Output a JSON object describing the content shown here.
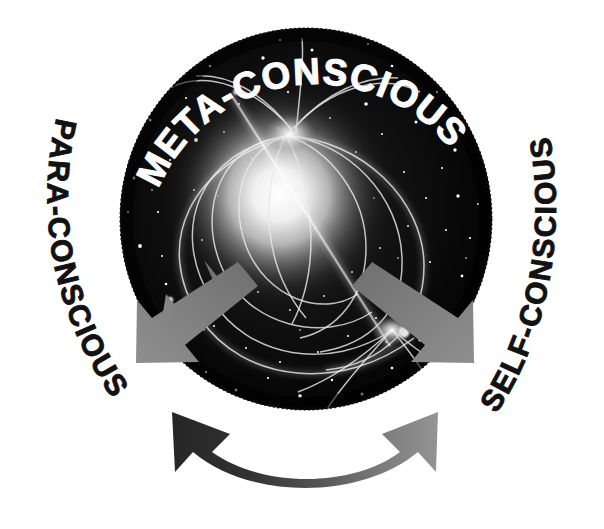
{
  "diagram": {
    "background_color": "#ffffff",
    "center": {
      "name": "magnetar-sphere",
      "description": "starfield sphere with glowing neutron star and magnetic field lines",
      "label": "META-CONSCIOUS",
      "label_color": "#fdfdfd",
      "sphere_color": "#050505",
      "glow_color": "#ffffff",
      "cx": 306,
      "cy": 219,
      "rx": 186,
      "ry": 191
    },
    "labels": {
      "top": "META-CONSCIOUS",
      "left": "PARA-CONSCIOUS",
      "right": "SELF-CONSCIOUS"
    },
    "label_colors": {
      "top": "#fdfdfd",
      "left": "#121212",
      "right": "#121212"
    },
    "arrows": [
      {
        "name": "arrow-to-para-conscious",
        "direction": "down-left",
        "color": "#8a8a8a",
        "from": "meta-conscious",
        "to": "para-conscious"
      },
      {
        "name": "arrow-to-self-conscious",
        "direction": "down-right",
        "color": "#8a8a8a",
        "from": "meta-conscious",
        "to": "self-conscious"
      },
      {
        "name": "arrow-bidirectional-bottom",
        "direction": "double-headed-curved",
        "color_start": "#2a2a2a",
        "color_end": "#8f8f8f",
        "from": "para-conscious",
        "to": "self-conscious"
      }
    ]
  }
}
